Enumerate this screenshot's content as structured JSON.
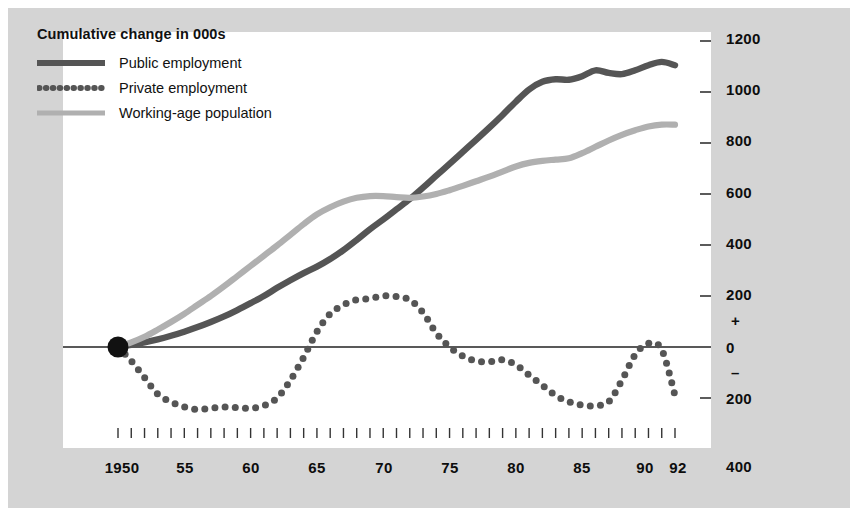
{
  "figure": {
    "background_color": "#d4d4d4",
    "panel_color": "#ffffff"
  },
  "legend": {
    "title": "Cumulative change in 000s",
    "items": [
      {
        "label": "Public employment",
        "style": "solid",
        "color": "#555555",
        "icon": "line-solid-dark-icon"
      },
      {
        "label": "Private employment",
        "style": "dotted",
        "color": "#555555",
        "icon": "line-dotted-dark-icon"
      },
      {
        "label": "Working-age population",
        "style": "solid",
        "color": "#b0b0b0",
        "icon": "line-solid-light-icon"
      }
    ]
  },
  "axes": {
    "y_tick_labels": [
      "1200",
      "1000",
      "800",
      "600",
      "400",
      "200",
      "0",
      "200",
      "400"
    ],
    "y_sign_positive": "+",
    "y_sign_negative": "–",
    "x_tick_labels": [
      "1950",
      "55",
      "60",
      "65",
      "70",
      "75",
      "80",
      "85",
      "90",
      "92"
    ]
  },
  "chart_data": {
    "type": "line",
    "title": "Cumulative change in 000s",
    "xlabel": "",
    "ylabel": "Cumulative change in 000s",
    "xlim": [
      1950,
      1992
    ],
    "ylim": [
      -400,
      1200
    ],
    "y_ticks": [
      -400,
      -200,
      0,
      200,
      400,
      600,
      800,
      1000,
      1200
    ],
    "x_ticks": [
      1950,
      1955,
      1960,
      1965,
      1970,
      1975,
      1980,
      1985,
      1990,
      1992
    ],
    "grid": false,
    "legend_position": "top-left",
    "origin_marker": {
      "x": 1950,
      "y": 0,
      "color": "#111111",
      "shape": "circle"
    },
    "zero_line": true,
    "x": [
      1950,
      1951,
      1952,
      1953,
      1954,
      1955,
      1956,
      1957,
      1958,
      1959,
      1960,
      1961,
      1962,
      1963,
      1964,
      1965,
      1966,
      1967,
      1968,
      1969,
      1970,
      1971,
      1972,
      1973,
      1974,
      1975,
      1976,
      1977,
      1978,
      1979,
      1980,
      1981,
      1982,
      1983,
      1984,
      1985,
      1986,
      1987,
      1988,
      1989,
      1990,
      1991,
      1992
    ],
    "series": [
      {
        "name": "Public employment",
        "color": "#555555",
        "style": "solid",
        "values": [
          0,
          8,
          18,
          30,
          44,
          60,
          78,
          98,
          120,
          145,
          172,
          200,
          232,
          262,
          290,
          315,
          345,
          380,
          420,
          462,
          500,
          540,
          580,
          625,
          672,
          718,
          765,
          812,
          860,
          910,
          962,
          1010,
          1040,
          1050,
          1048,
          1062,
          1085,
          1075,
          1070,
          1085,
          1105,
          1118,
          1105
        ]
      },
      {
        "name": "Private employment",
        "color": "#555555",
        "style": "dotted",
        "values": [
          0,
          -55,
          -120,
          -185,
          -215,
          -235,
          -245,
          -240,
          -235,
          -238,
          -240,
          -230,
          -200,
          -130,
          -40,
          60,
          130,
          165,
          185,
          190,
          200,
          198,
          185,
          135,
          55,
          0,
          -35,
          -55,
          -58,
          -50,
          -70,
          -110,
          -150,
          -190,
          -215,
          -228,
          -230,
          -215,
          -130,
          -30,
          15,
          -10,
          -190
        ]
      },
      {
        "name": "Working-age population",
        "color": "#b0b0b0",
        "style": "solid",
        "values": [
          0,
          18,
          40,
          68,
          98,
          130,
          165,
          200,
          238,
          278,
          318,
          358,
          398,
          440,
          482,
          520,
          548,
          570,
          585,
          592,
          592,
          588,
          585,
          590,
          600,
          615,
          632,
          650,
          668,
          688,
          708,
          722,
          730,
          735,
          740,
          760,
          785,
          810,
          832,
          850,
          865,
          872,
          872
        ]
      }
    ]
  }
}
